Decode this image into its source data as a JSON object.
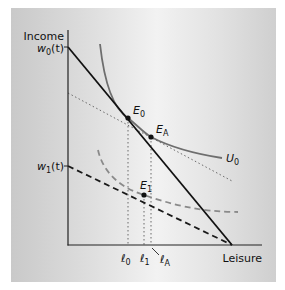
{
  "diagram": {
    "type": "labor-leisure choice",
    "axes": {
      "y_label": "Income",
      "x_label": "Leisure"
    },
    "intercepts": {
      "w0": {
        "base": "w",
        "sub": "0",
        "suffix": "(t)"
      },
      "w1": {
        "base": "w",
        "sub": "1",
        "suffix": "(t)"
      }
    },
    "points": {
      "E0": {
        "base": "E",
        "sub": "0"
      },
      "EA": {
        "base": "E",
        "sub": "A"
      },
      "E1": {
        "base": "E",
        "sub": "1"
      }
    },
    "curve_labels": {
      "U0": {
        "base": "U",
        "sub": "0"
      }
    },
    "leisure_marks": {
      "l0": {
        "base": "ℓ",
        "sub": "0"
      },
      "l1": {
        "base": "ℓ",
        "sub": "1"
      },
      "lA": {
        "base": "ℓ",
        "sub": "A"
      }
    },
    "colors": {
      "budget_line": "#111111",
      "indifference_curve": "#6e6e6e",
      "dashed_budget": "#1a1a1a",
      "dashed_curve": "#8a8a8a",
      "dotted": "#6a6a6a",
      "panel_mid": "#f2f2f2",
      "panel_edge": "#c9c9c9"
    }
  }
}
